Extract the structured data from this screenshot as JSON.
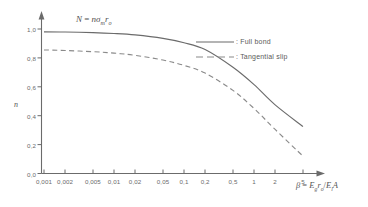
{
  "chart_data": {
    "type": "line",
    "title": "",
    "annotation": "N = nσₘrₒ",
    "annotation_parts": {
      "lhs": "N",
      "eq": "=",
      "rhs_n": "n",
      "rhs_sigma": "σ",
      "rhs_sigma_sub": "m",
      "rhs_r": "r",
      "rhs_r_sub": "o"
    },
    "xlabel": "β = E₉rₒ/EₗA",
    "xlabel_parts": {
      "beta": "β",
      "eq": "=",
      "e1": "E",
      "e1_sub": "g",
      "r": "r",
      "r_sub": "o",
      "slash": "/",
      "e2": "E",
      "e2_sub": "l",
      "a": "A"
    },
    "ylabel": "n",
    "xscale": "log",
    "xtick_labels": [
      "0,001",
      "0,002",
      "0,005",
      "0,01",
      "0,02",
      "0,05",
      "0,1",
      "0,2",
      "0,5",
      "1",
      "2",
      "5"
    ],
    "xtick_values": [
      0.001,
      0.002,
      0.005,
      0.01,
      0.02,
      0.05,
      0.1,
      0.2,
      0.5,
      1,
      2,
      5
    ],
    "ytick_labels": [
      "0,0",
      "0,2",
      "0,4",
      "0,6",
      "0,8",
      "1,0"
    ],
    "ytick_values": [
      0.0,
      0.2,
      0.4,
      0.6,
      0.8,
      1.0
    ],
    "xlim": [
      0.001,
      8
    ],
    "ylim": [
      0.0,
      1.08
    ],
    "grid": false,
    "legend_position": "top-right",
    "series": [
      {
        "name": "Full bond",
        "legend_label": ": Full bond",
        "style": "solid",
        "color": "#6b6b6b",
        "x": [
          0.001,
          0.002,
          0.005,
          0.01,
          0.02,
          0.05,
          0.1,
          0.2,
          0.5,
          1.0,
          2.0,
          5.0
        ],
        "values": [
          0.98,
          0.979,
          0.975,
          0.969,
          0.959,
          0.935,
          0.905,
          0.858,
          0.735,
          0.615,
          0.475,
          0.325
        ]
      },
      {
        "name": "Tangential slip",
        "legend_label": ": Tangential slip",
        "style": "dashed",
        "color": "#8a8a8a",
        "x": [
          0.001,
          0.002,
          0.005,
          0.01,
          0.02,
          0.05,
          0.1,
          0.2,
          0.5,
          1.0,
          2.0,
          5.0
        ],
        "values": [
          0.855,
          0.851,
          0.843,
          0.833,
          0.818,
          0.785,
          0.748,
          0.695,
          0.575,
          0.45,
          0.305,
          0.12
        ]
      }
    ]
  },
  "axes": {
    "x_axis_name": "x-axis",
    "y_axis_name": "y-axis"
  }
}
